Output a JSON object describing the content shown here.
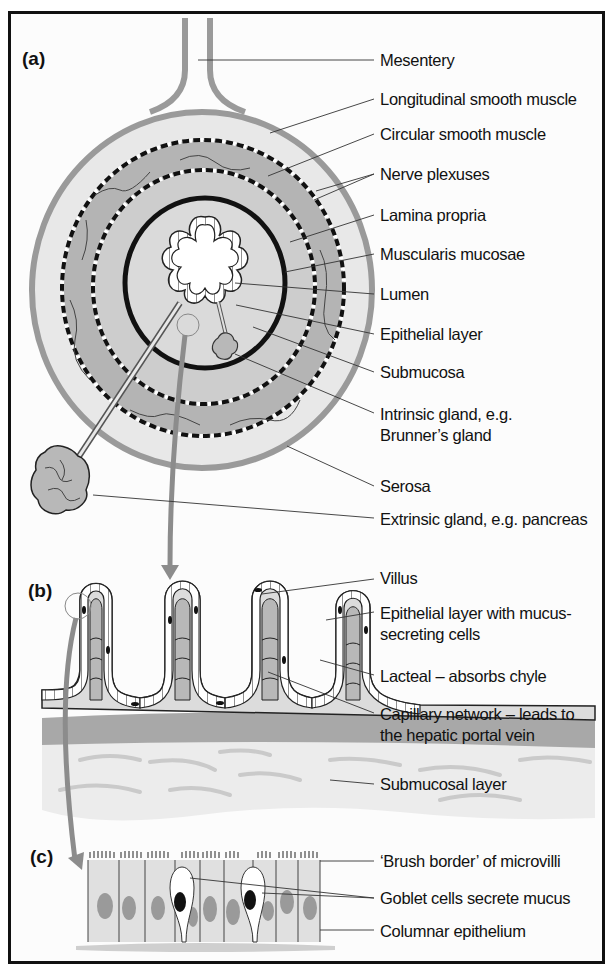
{
  "panels": {
    "a": {
      "label": "(a)",
      "annotations": [
        {
          "text": "Mesentery"
        },
        {
          "text": "Longitudinal smooth muscle"
        },
        {
          "text": "Circular smooth muscle"
        },
        {
          "text": "Nerve plexuses"
        },
        {
          "text": "Lamina propria"
        },
        {
          "text": "Muscularis mucosae"
        },
        {
          "text": "Lumen"
        },
        {
          "text": "Epithelial layer"
        },
        {
          "text": "Submucosa"
        },
        {
          "text": "Intrinsic gland, e.g.",
          "text2": "Brunner’s gland"
        },
        {
          "text": "Serosa"
        },
        {
          "text": "Extrinsic gland, e.g. pancreas"
        }
      ]
    },
    "b": {
      "label": "(b)",
      "annotations": [
        {
          "text": "Villus"
        },
        {
          "text": "Epithelial layer with mucus-",
          "text2": "secreting cells"
        },
        {
          "text": "Lacteal – absorbs chyle"
        },
        {
          "text": "Capillary network – leads to",
          "text2": "the hepatic portal vein"
        },
        {
          "text": "Submucosal layer"
        }
      ]
    },
    "c": {
      "label": "(c)",
      "annotations": [
        {
          "text": "‘Brush border’ of microvilli"
        },
        {
          "text": "Goblet cells secrete mucus"
        },
        {
          "text": "Columnar epithelium"
        }
      ]
    }
  },
  "colors": {
    "serosa": "#9a9a9a",
    "longitudinal_muscle": "#e6e6e6",
    "circular_muscle": "#b4b4b4",
    "submucosa": "#cfcfcf",
    "mucosa_inner": "#e2e2e2",
    "gland": "#b8b8b8",
    "arrow": "#8c8c8c",
    "nucleus_grey": "#9a9a9a",
    "nucleus_black": "#111111"
  }
}
